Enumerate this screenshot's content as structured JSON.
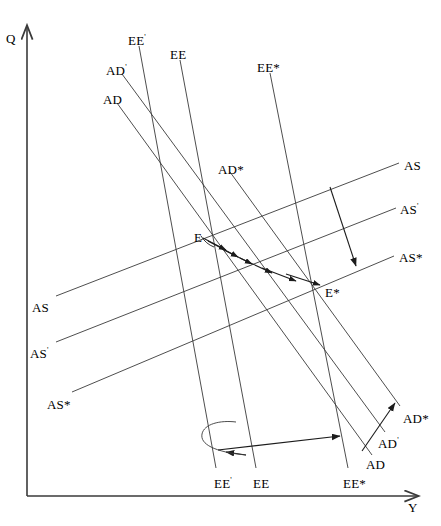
{
  "figure": {
    "domain": "Diagram",
    "kind": "economics-line-diagram",
    "background_color": "#ffffff",
    "line_color": "#3a3a3a",
    "text_color": "#000000",
    "width": 441,
    "height": 526,
    "top_caption_fragment": ""
  },
  "axes": {
    "y_axis_label": "Q",
    "x_axis_label": "Y",
    "y_axis": {
      "x": 27,
      "y_top": 22,
      "y_bottom": 496
    },
    "x_axis": {
      "y": 496,
      "x_left": 27,
      "x_right": 425
    }
  },
  "labels": {
    "top_left_group": [
      {
        "name": "EE-prime-top",
        "text": "EE",
        "sup": "'",
        "x": 128,
        "y": 34
      },
      {
        "name": "EE-top",
        "text": "EE",
        "sup": "",
        "x": 170,
        "y": 48
      },
      {
        "name": "AD-prime-top",
        "text": "AD",
        "sup": "'",
        "x": 106,
        "y": 64
      },
      {
        "name": "AD-top",
        "text": "AD",
        "sup": "",
        "x": 103,
        "y": 93
      }
    ],
    "top_mid_group": [
      {
        "name": "EE-star-top",
        "text": "EE*",
        "sup": "",
        "x": 257,
        "y": 61
      },
      {
        "name": "AD-star-mid",
        "text": "AD*",
        "sup": "",
        "x": 218,
        "y": 163
      }
    ],
    "right_group": [
      {
        "name": "AS-right",
        "text": "AS",
        "sup": "",
        "x": 404,
        "y": 159
      },
      {
        "name": "AS-prime-right",
        "text": "AS",
        "sup": "'",
        "x": 400,
        "y": 203
      },
      {
        "name": "AS-star-right",
        "text": "AS*",
        "sup": "",
        "x": 399,
        "y": 251
      }
    ],
    "left_group": [
      {
        "name": "AS-left",
        "text": "AS",
        "sup": "",
        "x": 32,
        "y": 301
      },
      {
        "name": "AS-prime-left",
        "text": "AS",
        "sup": "'",
        "x": 30,
        "y": 347
      },
      {
        "name": "AS-star-left",
        "text": "AS*",
        "sup": "",
        "x": 47,
        "y": 398
      }
    ],
    "equilibria": [
      {
        "name": "equilibrium-E",
        "text": "E",
        "sup": "",
        "x": 194,
        "y": 231
      },
      {
        "name": "equilibrium-E-star",
        "text": "E*",
        "sup": "",
        "x": 325,
        "y": 286
      }
    ],
    "bottom_group": [
      {
        "name": "EE-prime-bottom",
        "text": "EE",
        "sup": "'",
        "x": 214,
        "y": 477
      },
      {
        "name": "EE-bottom",
        "text": "EE",
        "sup": "",
        "x": 253,
        "y": 477
      },
      {
        "name": "EE-star-bottom",
        "text": "EE*",
        "sup": "",
        "x": 343,
        "y": 477
      }
    ],
    "bottom_right_group": [
      {
        "name": "AD-star-bottom",
        "text": "AD*",
        "sup": "",
        "x": 403,
        "y": 412
      },
      {
        "name": "AD-prime-bottom",
        "text": "AD",
        "sup": "'",
        "x": 378,
        "y": 437
      },
      {
        "name": "AD-bottom",
        "text": "AD",
        "sup": "",
        "x": 366,
        "y": 458
      }
    ]
  },
  "curves": [
    {
      "name": "AD-curve",
      "label": "AD",
      "x1": 117,
      "y1": 103,
      "x2": 372,
      "y2": 455
    },
    {
      "name": "AD-prime-curve",
      "label": "AD'",
      "x1": 122,
      "y1": 74,
      "x2": 385,
      "y2": 432
    },
    {
      "name": "AD-star-curve",
      "label": "AD*",
      "x1": 230,
      "y1": 172,
      "x2": 400,
      "y2": 406
    },
    {
      "name": "EE-prime-curve",
      "label": "EE'",
      "x1": 139,
      "y1": 46,
      "x2": 216,
      "y2": 468
    },
    {
      "name": "EE-curve",
      "label": "EE",
      "x1": 180,
      "y1": 60,
      "x2": 256,
      "y2": 468
    },
    {
      "name": "EE-star-curve",
      "label": "EE*",
      "x1": 270,
      "y1": 73,
      "x2": 348,
      "y2": 468
    },
    {
      "name": "AS-curve",
      "label": "AS",
      "x1": 56,
      "y1": 296,
      "x2": 399,
      "y2": 163
    },
    {
      "name": "AS-prime-curve",
      "label": "AS'",
      "x1": 56,
      "y1": 342,
      "x2": 396,
      "y2": 208
    },
    {
      "name": "AS-star-curve",
      "label": "AS*",
      "x1": 72,
      "y1": 392,
      "x2": 394,
      "y2": 256
    }
  ],
  "annotations": {
    "adjustment_path": {
      "name": "adjustment-path-E-to-E-star",
      "from": "E",
      "to": "E*",
      "style": "zigzag-arrow-sequence",
      "arrow_count": 6
    },
    "as_shift_arrow": {
      "name": "as-downward-shift-arrow",
      "description": "downward arrow from AS to AS*",
      "x1": 330,
      "y1": 187,
      "x2": 355,
      "y2": 265
    },
    "ad_shift_arrow": {
      "name": "ad-upward-shift-arrow",
      "description": "upward-right arrow from AD to AD*",
      "x1": 362,
      "y1": 450,
      "x2": 394,
      "y2": 404
    },
    "ee_left_arrow": {
      "name": "ee-leftward-curved-arrow",
      "description": "curved U-turn arrow pointing left from EE to EE'"
    },
    "ee_right_arrow": {
      "name": "ee-rightward-arrow",
      "description": "rightward arrow from EE' toward EE*",
      "x1": 218,
      "y1": 449,
      "x2": 340,
      "y2": 435
    }
  }
}
